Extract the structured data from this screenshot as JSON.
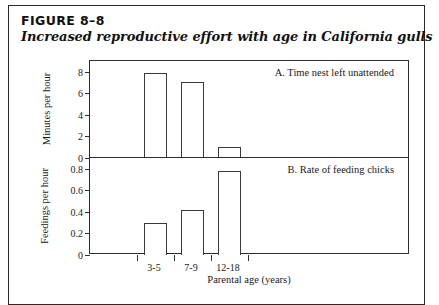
{
  "figure": {
    "number": "FIGURE 8–8",
    "title": "Increased reproductive effort with age in California gulls"
  },
  "chart_data": {
    "type": "bar",
    "title": "Increased reproductive effort with age in California gulls",
    "xlabel": "Parental age (years)",
    "categories": [
      "3-5",
      "7-9",
      "12-18"
    ],
    "grid": false,
    "legend": "none",
    "panels": [
      {
        "key": "A",
        "label": "A. Time nest left unattended",
        "ylabel": "Minutes per hour",
        "ylim": [
          0,
          9
        ],
        "yticks": [
          0,
          2,
          4,
          6,
          8
        ],
        "ytick_labels": [
          "0",
          "2",
          "4",
          "6",
          "8"
        ],
        "values": [
          7.8,
          7.0,
          0.9
        ]
      },
      {
        "key": "B",
        "label": "B. Rate of feeding chicks",
        "ylabel": "Feedings per hour",
        "ylim": [
          0,
          0.9
        ],
        "yticks": [
          0,
          0.2,
          0.4,
          0.6,
          0.8
        ],
        "ytick_labels": [
          "0",
          "0.2",
          "0.4",
          "0.6",
          "0.8"
        ],
        "values": [
          0.3,
          0.42,
          0.78
        ]
      }
    ]
  },
  "colors": {
    "bar_outline": "#3a3a3a",
    "bar_fill": "#ffffff",
    "axis": "#2e2e2e",
    "border": "#2a2a2a",
    "text": "#1a1a1a"
  }
}
